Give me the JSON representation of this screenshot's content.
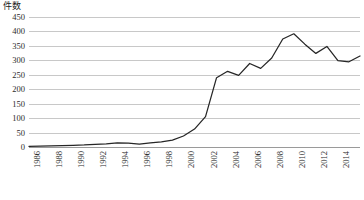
{
  "chart_data": {
    "type": "line",
    "title": "",
    "xlabel": "",
    "ylabel": "件数",
    "ylim": [
      0,
      450
    ],
    "ytick_step": 50,
    "yticks": [
      0,
      50,
      100,
      150,
      200,
      250,
      300,
      350,
      400,
      450
    ],
    "xlim": [
      1986,
      2016
    ],
    "xticks": [
      1986,
      1988,
      1990,
      1992,
      1994,
      1996,
      1998,
      2000,
      2002,
      2004,
      2006,
      2008,
      2010,
      2012,
      2014,
      2016
    ],
    "grid": true,
    "legend": "none",
    "line_color": "#262626",
    "grid_color": "#c8c8c8",
    "series": [
      {
        "name": "件数",
        "x": [
          1986,
          1987,
          1988,
          1989,
          1990,
          1991,
          1992,
          1993,
          1994,
          1995,
          1996,
          1997,
          1998,
          1999,
          2000,
          2001,
          2002,
          2003,
          2004,
          2005,
          2006,
          2007,
          2008,
          2009,
          2010,
          2011,
          2012,
          2013,
          2014,
          2015,
          2016
        ],
        "values": [
          2,
          3,
          4,
          5,
          6,
          7,
          9,
          11,
          14,
          13,
          10,
          14,
          18,
          24,
          38,
          62,
          105,
          240,
          262,
          248,
          289,
          272,
          308,
          374,
          392,
          356,
          324,
          348,
          299,
          295,
          315
        ]
      }
    ]
  },
  "axis": {
    "y_caption": "件数"
  }
}
